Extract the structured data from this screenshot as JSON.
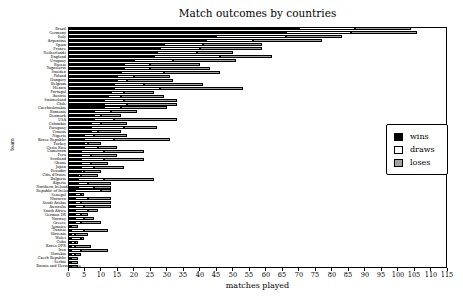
{
  "figure": {
    "kind": "matplotlib-style horizontal stacked bar chart"
  },
  "chart_data": {
    "type": "bar",
    "orientation": "horizontal",
    "stacked": true,
    "title": "Match outcomes by countries",
    "xlabel": "matches played",
    "ylabel": "team",
    "xlim": [
      0,
      115
    ],
    "xticks": [
      0,
      5,
      10,
      15,
      20,
      25,
      30,
      35,
      40,
      45,
      50,
      55,
      60,
      65,
      70,
      75,
      80,
      85,
      90,
      95,
      100,
      105,
      110,
      115
    ],
    "grid": false,
    "legend_position": "center right",
    "categories": [
      "Brazil",
      "Germany",
      "Italy",
      "Argentina",
      "Spain",
      "France",
      "Netherlands",
      "England",
      "Uruguay",
      "Russia",
      "Yugoslavia",
      "Sweden",
      "Poland",
      "Hungary",
      "Belgium",
      "Mexico",
      "Portugal",
      "Austria",
      "Switzerland",
      "Chile",
      "Czechoslovakia",
      "Romania",
      "Denmark",
      "USA",
      "Colombia",
      "Paraguay",
      "Croatia",
      "Nigeria",
      "Korea Republic",
      "Turkey",
      "Costa Rica",
      "Cameroon",
      "Peru",
      "Scotland",
      "Ghana",
      "Japan",
      "Ecuador",
      "Côte d'Ivoire",
      "Bulgaria",
      "Algeria",
      "Northern Ireland",
      "Republic of Ireland",
      "Senegal",
      "Morocco",
      "Saudi Arabia",
      "Australia",
      "South Africa",
      "German DR",
      "Norway",
      "Greece",
      "Jamaica",
      "Tunisia",
      "Slovenia",
      "Wales",
      "Cuba",
      "Korea DPR",
      "Iran",
      "Slovakia",
      "Czech Republic",
      "Serbia",
      "Bosnia and Herzegovina"
    ],
    "series": [
      {
        "name": "wins",
        "color": "#000000",
        "values": [
          70,
          66,
          45,
          42,
          29,
          28,
          27,
          26,
          20,
          17,
          17,
          16,
          15,
          15,
          14,
          14,
          13,
          12,
          11,
          11,
          11,
          8,
          8,
          8,
          7,
          7,
          7,
          5,
          5,
          5,
          5,
          4,
          4,
          4,
          4,
          4,
          4,
          3,
          3,
          3,
          3,
          2,
          2,
          2,
          2,
          2,
          2,
          2,
          2,
          2,
          1,
          1,
          1,
          1,
          1,
          1,
          1,
          1,
          1,
          1,
          1
        ]
      },
      {
        "name": "draws",
        "color": "#ffffff",
        "values": [
          17,
          20,
          21,
          14,
          12,
          12,
          12,
          20,
          12,
          8,
          8,
          13,
          5,
          3,
          9,
          14,
          4,
          4,
          6,
          7,
          5,
          5,
          2,
          6,
          3,
          10,
          2,
          3,
          9,
          1,
          4,
          7,
          3,
          7,
          3,
          4,
          1,
          1,
          8,
          3,
          5,
          8,
          2,
          4,
          2,
          3,
          4,
          2,
          3,
          2,
          0,
          4,
          1,
          3,
          1,
          1,
          3,
          1,
          0,
          0,
          0
        ]
      },
      {
        "name": "loses",
        "color": "#a3a3a3",
        "values": [
          17,
          20,
          17,
          21,
          18,
          19,
          11,
          16,
          19,
          15,
          18,
          17,
          11,
          14,
          18,
          25,
          9,
          13,
          16,
          15,
          14,
          8,
          6,
          19,
          8,
          10,
          7,
          10,
          17,
          4,
          6,
          12,
          8,
          12,
          5,
          9,
          5,
          5,
          15,
          7,
          5,
          3,
          1,
          7,
          9,
          8,
          3,
          2,
          3,
          6,
          2,
          7,
          4,
          1,
          1,
          5,
          8,
          2,
          2,
          2,
          2
        ]
      }
    ]
  }
}
